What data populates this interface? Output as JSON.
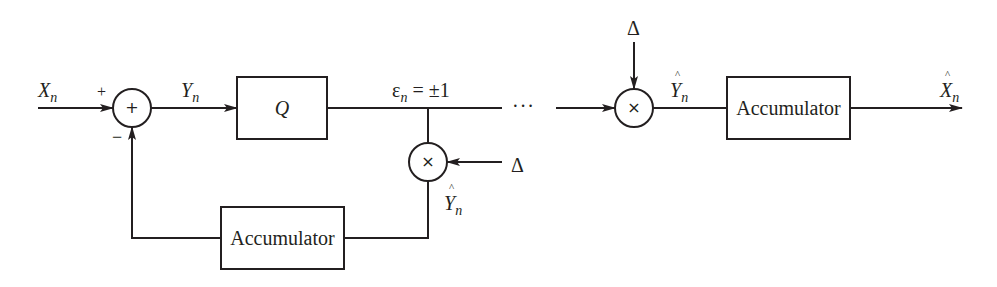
{
  "diagram": {
    "encoder": {
      "input_label": "X",
      "input_sub": "n",
      "plus_sign": "+",
      "minus_sign": "−",
      "summer_symbol": "+",
      "after_sum_label": "Y",
      "after_sum_sub": "n",
      "quantizer_label": "Q",
      "quantizer_output_label_main": "ε",
      "quantizer_output_sub": "n",
      "quantizer_output_value": " = ±1",
      "multiplier_symbol": "×",
      "step_label": "Δ",
      "feedback_label": "Y",
      "feedback_sub": "n",
      "accumulator_label": "Accumulator"
    },
    "channel": {
      "ellipsis": "···"
    },
    "decoder": {
      "step_label": "Δ",
      "multiplier_symbol": "×",
      "multiplier_output_label": "Y",
      "multiplier_output_sub": "n",
      "accumulator_label": "Accumulator",
      "output_label": "X",
      "output_sub": "n"
    }
  }
}
